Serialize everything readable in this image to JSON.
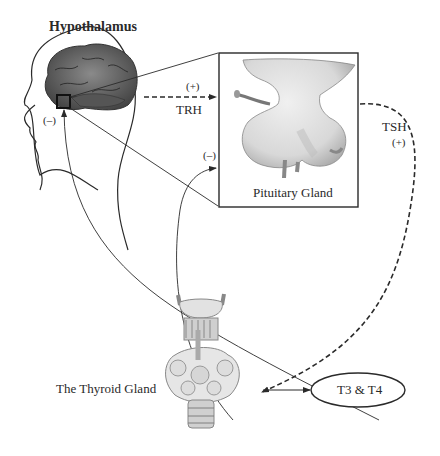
{
  "labels": {
    "hypothalamus": "Hypothalamus",
    "pituitary": "Pituitary Gland",
    "thyroid": "The Thyroid Gland",
    "hormones": "T3 & T4",
    "trh": "TRH",
    "tsh": "TSH",
    "trh_sign": "(+)",
    "tsh_sign": "(+)",
    "feedback_hypothalamus_sign": "(–)",
    "feedback_pituitary_sign": "(–)"
  },
  "colors": {
    "line": "#2a2a2a",
    "brain_dark": "#4a4a4a",
    "brain_mid": "#7a7a7a",
    "gland_fill": "#e2e2e2",
    "gland_shade": "#b8b8b8"
  }
}
